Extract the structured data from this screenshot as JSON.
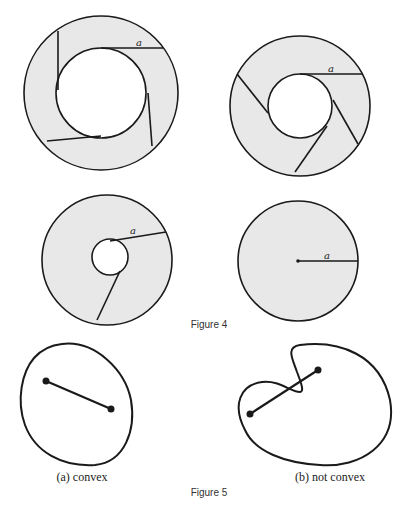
{
  "figure4": {
    "caption": "Figure 4",
    "fill_color": "#e8e8e8",
    "stroke_color": "#1a1a1a",
    "panels": [
      {
        "name": "annulus-large-hole",
        "radius_label": "a",
        "cuts": 4
      },
      {
        "name": "annulus-medium-hole",
        "radius_label": "a",
        "cuts": 4
      },
      {
        "name": "annulus-small-hole",
        "radius_label": "a",
        "cuts": 2
      },
      {
        "name": "disk",
        "radius_label": "a",
        "cuts": 0
      }
    ]
  },
  "figure5": {
    "caption": "Figure 5",
    "panels": [
      {
        "name": "convex-region",
        "label": "(a) convex"
      },
      {
        "name": "nonconvex-region",
        "label": "(b) not convex"
      }
    ]
  }
}
